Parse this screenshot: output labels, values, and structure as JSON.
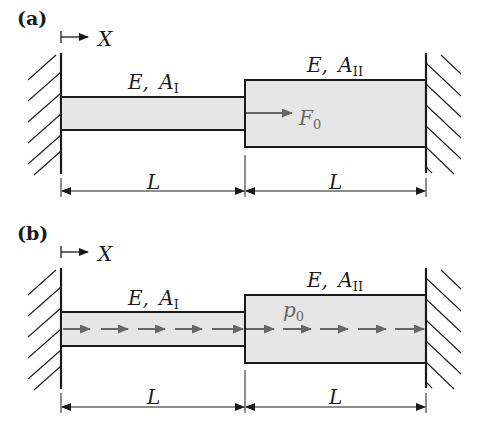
{
  "figure": {
    "panels": [
      {
        "id": "a",
        "label": "(a)",
        "axis_label": "X",
        "segment_1": {
          "label_E": "E,",
          "label_A": "A",
          "label_A_sub": "I",
          "length_label": "L"
        },
        "segment_2": {
          "label_E": "E,",
          "label_A": "A",
          "label_A_sub": "II",
          "length_label": "L"
        },
        "load": {
          "type": "point-force",
          "label": "F",
          "label_sub": "0",
          "color": "#666666"
        }
      },
      {
        "id": "b",
        "label": "(b)",
        "axis_label": "X",
        "segment_1": {
          "label_E": "E,",
          "label_A": "A",
          "label_A_sub": "I",
          "length_label": "L"
        },
        "segment_2": {
          "label_E": "E,",
          "label_A": "A",
          "label_A_sub": "II",
          "length_label": "L"
        },
        "load": {
          "type": "distributed-load",
          "label": "p",
          "label_sub": "0",
          "color": "#666666"
        }
      }
    ],
    "colors": {
      "bar_fill": "#e6e6e6",
      "stroke": "#1a1a1a",
      "load": "#666666"
    }
  }
}
